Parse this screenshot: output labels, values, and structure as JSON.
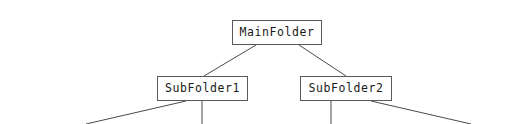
{
  "diagram": {
    "background_color": "#ffffff",
    "edge_color": "#4a4a4a",
    "node_border_color": "#5a5a5a",
    "node_fill_color": "#ffffff",
    "node_text_color": "#1a1a1a",
    "nodes": [
      {
        "id": "main",
        "label": "MainFolder",
        "x": 232,
        "y": 20,
        "width": 90,
        "height": 25
      },
      {
        "id": "sub1",
        "label": "SubFolder1",
        "x": 157,
        "y": 76,
        "width": 91,
        "height": 25
      },
      {
        "id": "sub2",
        "label": "SubFolder2",
        "x": 300,
        "y": 76,
        "width": 92,
        "height": 25
      }
    ],
    "edges": [
      {
        "id": "main-to-sub1",
        "x1": 256,
        "y1": 45,
        "x2": 204,
        "y2": 76
      },
      {
        "id": "main-to-sub2",
        "x1": 299,
        "y1": 45,
        "x2": 346,
        "y2": 76
      },
      {
        "id": "sub1-to-childA",
        "x1": 186,
        "y1": 101,
        "x2": 86,
        "y2": 124
      },
      {
        "id": "sub1-to-childB",
        "x1": 202,
        "y1": 101,
        "x2": 202,
        "y2": 124
      },
      {
        "id": "sub2-to-childA",
        "x1": 331,
        "y1": 101,
        "x2": 331,
        "y2": 124
      },
      {
        "id": "sub2-to-childB",
        "x1": 371,
        "y1": 101,
        "x2": 471,
        "y2": 124
      }
    ]
  }
}
